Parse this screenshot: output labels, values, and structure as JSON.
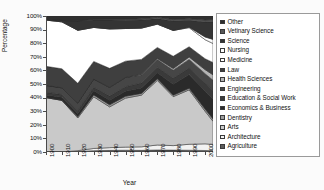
{
  "chart_data": {
    "type": "area",
    "stacked": true,
    "normalized": true,
    "title": "",
    "xlabel": "Year",
    "ylabel": "Percentage",
    "xlim": [
      1900,
      2005
    ],
    "ylim": [
      0,
      100
    ],
    "grid": false,
    "legend_position": "right",
    "x": [
      1900,
      1910,
      1920,
      1930,
      1940,
      1950,
      1960,
      1970,
      1980,
      1990,
      2000,
      2005
    ],
    "xtick_labels": [
      "1900",
      "1910",
      "1920",
      "1930",
      "1940",
      "1950",
      "1960",
      "1970",
      "1980",
      "1990",
      "2000"
    ],
    "ytick_labels": [
      "0%",
      "10%",
      "20%",
      "30%",
      "40%",
      "50%",
      "60%",
      "70%",
      "80%",
      "90%",
      "100%"
    ],
    "ytick_values": [
      0,
      10,
      20,
      30,
      40,
      50,
      60,
      70,
      80,
      90,
      100
    ],
    "stack_order_bottom_to_top": [
      "Agriculture",
      "Architecture",
      "Arts",
      "Dentistry",
      "Economics & Business",
      "Education & Social Work",
      "Engineering",
      "Health Sciences",
      "Law",
      "Medicine",
      "Nursing",
      "Science",
      "Vetinary Science",
      "Other"
    ],
    "series": [
      {
        "name": "Agriculture",
        "color": "#5c5c5c",
        "values": [
          0.0,
          0.0,
          0.4,
          1.0,
          1.2,
          1.3,
          1.2,
          1.5,
          1.4,
          1.3,
          1.1,
          1.0
        ]
      },
      {
        "name": "Architecture",
        "color": "#f2f2f2",
        "values": [
          0.0,
          0.0,
          0.6,
          1.6,
          2.0,
          2.3,
          2.6,
          3.6,
          3.3,
          4.4,
          4.9,
          4.6
        ]
      },
      {
        "name": "Arts",
        "color": "#c9c9c9",
        "values": [
          40.0,
          38.0,
          24.0,
          38.0,
          30.0,
          36.0,
          38.0,
          47.0,
          36.0,
          40.0,
          24.0,
          17.0
        ]
      },
      {
        "name": "Dentistry",
        "color": "#9e9e9e",
        "values": [
          0.0,
          0.0,
          1.0,
          1.4,
          1.5,
          1.4,
          1.3,
          1.2,
          1.1,
          1.2,
          1.6,
          1.7
        ]
      },
      {
        "name": "Economics & Business",
        "color": "#2a2a2a",
        "values": [
          2.0,
          2.2,
          2.4,
          3.0,
          3.4,
          3.6,
          4.0,
          4.4,
          8.0,
          10.0,
          13.0,
          14.5
        ]
      },
      {
        "name": "Education & Social Work",
        "color": "#3a3a3a",
        "values": [
          2.0,
          2.0,
          2.2,
          2.6,
          3.0,
          3.4,
          3.6,
          4.0,
          4.4,
          4.8,
          6.0,
          6.5
        ]
      },
      {
        "name": "Engineering",
        "color": "#464646",
        "values": [
          5.0,
          5.0,
          5.4,
          6.0,
          6.4,
          6.8,
          6.0,
          5.6,
          6.0,
          6.4,
          7.0,
          7.5
        ]
      },
      {
        "name": "Health Sciences",
        "color": "#b4b4b4",
        "values": [
          0.0,
          0.0,
          0.0,
          0.0,
          0.0,
          0.0,
          0.4,
          0.8,
          1.2,
          1.8,
          3.0,
          4.0
        ]
      },
      {
        "name": "Law",
        "color": "#3f3f3f",
        "values": [
          14.0,
          14.0,
          14.5,
          13.0,
          14.0,
          12.0,
          11.0,
          8.0,
          9.0,
          7.5,
          8.0,
          9.0
        ]
      },
      {
        "name": "Medicine",
        "color": "#ffffff",
        "values": [
          34.0,
          34.5,
          39.0,
          25.0,
          29.0,
          24.0,
          23.0,
          17.0,
          19.0,
          14.0,
          14.0,
          14.0
        ]
      },
      {
        "name": "Nursing",
        "color": "#fdfdfd",
        "values": [
          0.0,
          0.0,
          0.0,
          0.0,
          0.0,
          0.0,
          0.0,
          0.0,
          0.0,
          0.4,
          2.0,
          3.0
        ]
      },
      {
        "name": "Science",
        "color": "#343434",
        "values": [
          0.5,
          1.0,
          7.0,
          5.5,
          6.5,
          6.0,
          6.0,
          4.0,
          7.0,
          5.0,
          11.0,
          13.0
        ]
      },
      {
        "name": "Vetinary Science",
        "color": "#585858",
        "values": [
          0.0,
          0.0,
          0.0,
          0.4,
          0.6,
          0.7,
          0.8,
          0.9,
          1.0,
          1.1,
          1.4,
          1.5
        ]
      },
      {
        "name": "Other",
        "color": "#2f2f2f",
        "values": [
          2.5,
          3.3,
          3.5,
          2.5,
          2.4,
          2.5,
          2.1,
          1.0,
          2.6,
          2.1,
          3.0,
          2.7
        ]
      }
    ]
  },
  "legend": {
    "entries": [
      {
        "label": "Other",
        "color": "#2f2f2f"
      },
      {
        "label": "Vetinary Science",
        "color": "#585858"
      },
      {
        "label": "Science",
        "color": "#343434"
      },
      {
        "label": "Nursing",
        "color": "#fdfdfd"
      },
      {
        "label": "Medicine",
        "color": "#ffffff"
      },
      {
        "label": "Law",
        "color": "#3f3f3f"
      },
      {
        "label": "Health Sciences",
        "color": "#b4b4b4"
      },
      {
        "label": "Engineering",
        "color": "#464646"
      },
      {
        "label": "Education & Social Work",
        "color": "#3a3a3a"
      },
      {
        "label": "Economics & Business",
        "color": "#2a2a2a"
      },
      {
        "label": "Dentistry",
        "color": "#9e9e9e"
      },
      {
        "label": "Arts",
        "color": "#c9c9c9"
      },
      {
        "label": "Architecture",
        "color": "#f2f2f2"
      },
      {
        "label": "Agriculture",
        "color": "#5c5c5c"
      }
    ]
  }
}
